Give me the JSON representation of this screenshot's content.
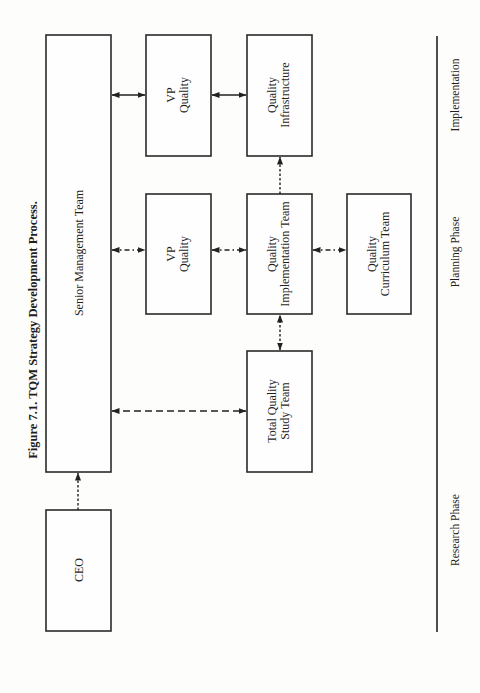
{
  "figure": {
    "title": "Figure 7.1.  TQM Strategy Development Process.",
    "orientation": "rotated 90° counter-clockwise"
  },
  "boxes": {
    "senior_management": {
      "label": "Senior Management Team"
    },
    "ceo": {
      "label": "CEO"
    },
    "vp_quality_impl": {
      "line1": "VP",
      "line2": "Quality"
    },
    "vp_quality_plan": {
      "line1": "VP",
      "line2": "Quality"
    },
    "quality_infrastructure": {
      "line1": "Quality",
      "line2": "Infrastructure"
    },
    "quality_implementation_team": {
      "line1": "Quality",
      "line2": "Implementation Team"
    },
    "quality_curriculum_team": {
      "line1": "Quality",
      "line2": "Curriculum Team"
    },
    "total_quality_study_team": {
      "line1": "Total Quality",
      "line2": "Study Team"
    }
  },
  "phases": {
    "implementation": "Implementation",
    "planning": "Planning Phase",
    "research": "Research Phase"
  },
  "connectors": [
    {
      "from": "ceo",
      "to": "senior_management",
      "style": "dotted",
      "direction": "single"
    },
    {
      "from": "senior_management",
      "to": "vp_quality_impl",
      "style": "solid",
      "direction": "both"
    },
    {
      "from": "vp_quality_impl",
      "to": "quality_infrastructure",
      "style": "solid",
      "direction": "both"
    },
    {
      "from": "senior_management",
      "to": "vp_quality_plan",
      "style": "dash-dot",
      "direction": "both"
    },
    {
      "from": "vp_quality_plan",
      "to": "quality_implementation_team",
      "style": "dash-dot",
      "direction": "both"
    },
    {
      "from": "quality_implementation_team",
      "to": "quality_curriculum_team",
      "style": "dash-dot",
      "direction": "both"
    },
    {
      "from": "quality_implementation_team",
      "to": "quality_infrastructure",
      "style": "dotted",
      "direction": "single"
    },
    {
      "from": "senior_management",
      "to": "total_quality_study_team",
      "style": "dashed",
      "direction": "both"
    },
    {
      "from": "total_quality_study_team",
      "to": "quality_implementation_team",
      "style": "dotted",
      "direction": "both"
    }
  ]
}
